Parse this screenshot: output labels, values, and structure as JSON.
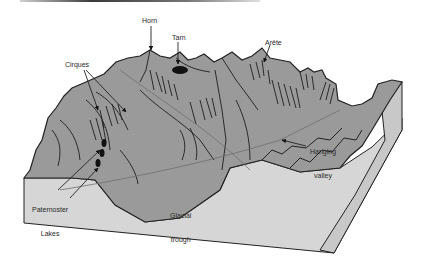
{
  "diagram": {
    "labels": {
      "horn": "Horn",
      "tarn": "Tarn",
      "arete": "Arête",
      "cirques": "Cirques",
      "hanging_valley_1": "Hanging",
      "hanging_valley_2": "valley",
      "paternoster_1": "Paternoster",
      "paternoster_2": "Lakes",
      "glacial_trough_1": "Glacial",
      "glacial_trough_2": "trough"
    },
    "colors": {
      "terrain": "#9a9a9a",
      "front_face": "#d6d6d6",
      "side_face": "#c4c4c4",
      "outline": "#222222",
      "water": "#111111",
      "background": "#ffffff"
    }
  }
}
